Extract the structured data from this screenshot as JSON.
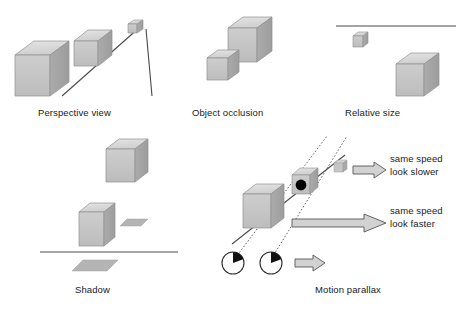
{
  "figure": {
    "background_color": "#ffffff",
    "line_color": "#3a3a3a",
    "text_color": "#1a1a1a"
  },
  "cube_palette": {
    "top_face": "#d9d9d9",
    "front_face": "#c4c4c4",
    "side_face": "#a6a6a6",
    "edge": "#8a8a8a",
    "shadow_fill": "#b0b0b0",
    "highlight_top": "#e2e2e2"
  },
  "panels": [
    {
      "id": "perspective",
      "caption": "Perspective view",
      "cue": "linear perspective",
      "cubes": [
        {
          "name": "near-cube",
          "size": "large"
        },
        {
          "name": "middle-cube",
          "size": "medium"
        },
        {
          "name": "far-cube",
          "size": "small"
        }
      ],
      "lines": [
        {
          "name": "perspective-line-left",
          "style": "solid"
        },
        {
          "name": "perspective-line-right",
          "style": "solid"
        }
      ]
    },
    {
      "id": "occlusion",
      "caption": "Object occlusion",
      "cue": "interposition",
      "cubes": [
        {
          "name": "back-cube",
          "size": "large"
        },
        {
          "name": "front-cube",
          "size": "small"
        }
      ]
    },
    {
      "id": "relative-size",
      "caption": "Relative size",
      "cue": "relative size",
      "cubes": [
        {
          "name": "small-cube",
          "size": "small"
        },
        {
          "name": "large-cube",
          "size": "large"
        }
      ],
      "lines": [
        {
          "name": "horizon-line",
          "style": "solid"
        }
      ]
    },
    {
      "id": "shadow",
      "caption": "Shadow",
      "cue": "cast shadow",
      "cubes": [
        {
          "name": "upper-cube",
          "size": "large"
        },
        {
          "name": "lower-cube",
          "size": "medium"
        }
      ],
      "shadows": [
        {
          "name": "floating-shadow"
        },
        {
          "name": "ground-shadow"
        }
      ],
      "lines": [
        {
          "name": "ground-line",
          "style": "solid"
        }
      ]
    },
    {
      "id": "motion-parallax",
      "caption": "Motion parallax",
      "cue": "motion parallax",
      "cubes": [
        {
          "name": "near-cube",
          "size": "large"
        },
        {
          "name": "fixation-cube",
          "size": "medium"
        },
        {
          "name": "far-cube",
          "size": "small"
        }
      ],
      "fixation_point": {
        "name": "fixation-dot",
        "color": "#000000"
      },
      "eyes": [
        {
          "name": "eye-left"
        },
        {
          "name": "eye-right"
        }
      ],
      "sight_lines": [
        {
          "name": "sight-line-left",
          "style": "dotted"
        },
        {
          "name": "sight-line-right",
          "style": "dotted"
        }
      ],
      "ground_line": {
        "name": "parallax-ground-line",
        "style": "solid"
      },
      "arrows": [
        {
          "name": "arrow-far",
          "length": "short",
          "label_ref": "slower"
        },
        {
          "name": "arrow-near",
          "length": "long",
          "label_ref": "faster"
        },
        {
          "name": "arrow-observer",
          "length": "short",
          "label_ref": ""
        }
      ],
      "annotations": {
        "slower": {
          "line1": "same speed",
          "line2": "look slower"
        },
        "faster": {
          "line1": "same speed",
          "line2": "look faster"
        }
      }
    }
  ]
}
